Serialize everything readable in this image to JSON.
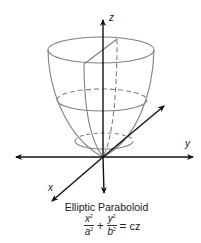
{
  "figure": {
    "title": "Elliptic Paraboloid",
    "axes": {
      "x_label": "x",
      "y_label": "y",
      "z_label": "z"
    },
    "formula": {
      "term1_num": "x",
      "term1_num_exp": "2",
      "term1_den": "a",
      "term1_den_exp": "2",
      "plus": "+",
      "term2_num": "y",
      "term2_num_exp": "2",
      "term2_den": "b",
      "term2_den_exp": "2",
      "equals": "=",
      "rhs": "cz"
    },
    "colors": {
      "axis": "#111111",
      "surface_outline": "#808080",
      "background": "#ffffff"
    }
  }
}
